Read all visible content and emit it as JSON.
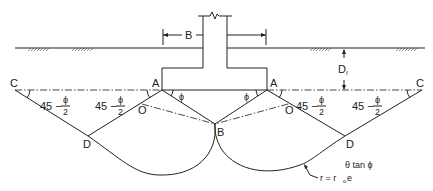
{
  "diagram": {
    "labels": {
      "width": "B",
      "depth": "D",
      "depth_sub": "f",
      "point_a": "A",
      "point_b": "B",
      "point_c": "C",
      "point_d": "D",
      "point_o": "O",
      "angle_phi": "ϕ",
      "angle_45": "45 −",
      "phi_num": "ϕ",
      "phi_den": "2",
      "spiral_eq_lhs": "r = r",
      "spiral_eq_sub": "o",
      "spiral_eq_e": "e",
      "spiral_eq_exp": "θ tan ϕ"
    },
    "colors": {
      "line": "#222222",
      "background": "#ffffff"
    }
  }
}
